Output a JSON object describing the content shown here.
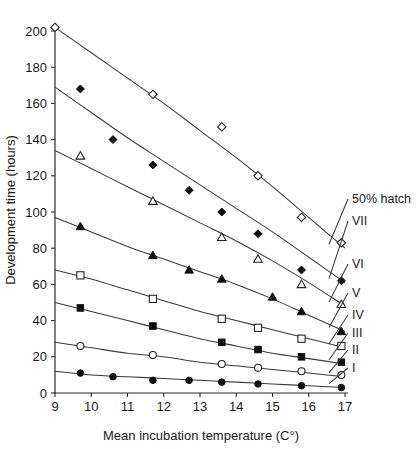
{
  "chart_data": {
    "type": "scatter",
    "title": "",
    "xlabel": "Mean incubation temperature (C°)",
    "ylabel": "Development time (hours)",
    "xlim": [
      9,
      17
    ],
    "ylim": [
      0,
      200
    ],
    "xticks": [
      9,
      10,
      11,
      12,
      13,
      14,
      15,
      16,
      17
    ],
    "yticks": [
      0,
      20,
      40,
      60,
      80,
      100,
      120,
      140,
      160,
      180,
      200
    ],
    "grid": false,
    "legend_position": "right-inline-labels",
    "series": [
      {
        "name": "50% hatch",
        "marker": "open-diamond",
        "fit": "decreasing-convex-curve",
        "x": [
          9.0,
          11.7,
          13.6,
          14.6,
          15.8,
          16.9
        ],
        "y": [
          202,
          165,
          147,
          120,
          97,
          83
        ],
        "fit_x": [
          9.0,
          10.0,
          11.0,
          12.0,
          13.0,
          14.0,
          15.0,
          16.0,
          17.0
        ],
        "fit_y": [
          202,
          188,
          174,
          160,
          145,
          130,
          114,
          97,
          80
        ]
      },
      {
        "name": "VII",
        "marker": "filled-diamond",
        "fit": "decreasing-convex-curve",
        "x": [
          9.7,
          10.6,
          11.7,
          12.7,
          13.6,
          14.6,
          15.8,
          16.9
        ],
        "y": [
          168,
          140,
          126,
          112,
          100,
          88,
          68,
          62
        ],
        "fit_x": [
          9.0,
          10.0,
          11.0,
          12.0,
          13.0,
          14.0,
          15.0,
          16.0,
          17.0
        ],
        "fit_y": [
          169,
          155,
          141,
          128,
          115,
          102,
          89,
          75,
          61
        ]
      },
      {
        "name": "VI",
        "marker": "open-triangle",
        "fit": "decreasing-convex-curve",
        "x": [
          9.7,
          11.7,
          13.6,
          14.6,
          15.8,
          16.9
        ],
        "y": [
          131,
          106,
          86,
          74,
          60,
          49
        ],
        "fit_x": [
          9.0,
          10.0,
          11.0,
          12.0,
          13.0,
          14.0,
          15.0,
          16.0,
          17.0
        ],
        "fit_y": [
          134,
          124,
          114,
          104,
          94,
          84,
          73,
          61,
          48
        ]
      },
      {
        "name": "V",
        "marker": "filled-triangle",
        "fit": "decreasing-convex-curve",
        "x": [
          9.7,
          11.7,
          12.7,
          13.6,
          15.0,
          15.8,
          16.9
        ],
        "y": [
          92,
          76,
          68,
          63,
          53,
          45,
          34
        ],
        "fit_x": [
          9.0,
          10.0,
          11.0,
          12.0,
          13.0,
          14.0,
          15.0,
          16.0,
          17.0
        ],
        "fit_y": [
          97,
          89,
          81,
          74,
          67,
          60,
          52,
          43,
          34
        ]
      },
      {
        "name": "IV",
        "marker": "open-square",
        "fit": "decreasing-convex-curve",
        "x": [
          9.7,
          11.7,
          13.6,
          14.6,
          15.8,
          16.9
        ],
        "y": [
          65,
          52,
          41,
          36,
          30,
          26
        ],
        "fit_x": [
          9.0,
          10.0,
          11.0,
          12.0,
          13.0,
          14.0,
          15.0,
          16.0,
          17.0
        ],
        "fit_y": [
          68,
          63,
          57,
          51,
          45,
          40,
          35,
          30,
          25
        ]
      },
      {
        "name": "III",
        "marker": "filled-square",
        "fit": "decreasing-convex-curve",
        "x": [
          9.7,
          11.7,
          13.6,
          14.6,
          15.8,
          16.9
        ],
        "y": [
          47,
          37,
          28,
          24,
          20,
          17
        ],
        "fit_x": [
          9.0,
          10.0,
          11.0,
          12.0,
          13.0,
          14.0,
          15.0,
          16.0,
          17.0
        ],
        "fit_y": [
          50,
          45,
          40,
          35,
          30,
          26,
          22,
          19,
          16
        ]
      },
      {
        "name": "II",
        "marker": "open-circle",
        "fit": "decreasing-convex-curve",
        "x": [
          9.7,
          11.7,
          13.6,
          14.6,
          15.8,
          16.9
        ],
        "y": [
          26,
          21,
          16,
          14,
          12,
          10
        ],
        "fit_x": [
          9.0,
          10.0,
          11.0,
          12.0,
          13.0,
          14.0,
          15.0,
          16.0,
          17.0
        ],
        "fit_y": [
          28,
          25,
          22,
          20,
          17,
          15,
          13,
          11,
          9
        ]
      },
      {
        "name": "I",
        "marker": "filled-circle",
        "fit": "decreasing-convex-curve",
        "x": [
          9.7,
          10.6,
          11.7,
          12.7,
          13.6,
          14.6,
          15.8,
          16.9
        ],
        "y": [
          11,
          9,
          7,
          7,
          6,
          5,
          4,
          3
        ],
        "fit_x": [
          9.0,
          10.0,
          11.0,
          12.0,
          13.0,
          14.0,
          15.0,
          16.0,
          17.0
        ],
        "fit_y": [
          12,
          10,
          9,
          8,
          7,
          6,
          5,
          4,
          3
        ]
      }
    ],
    "series_labels": [
      {
        "text": "50% hatch",
        "at_y": 203,
        "leader_from_y": 250
      },
      {
        "text": "VII",
        "at_y": 225,
        "leader_from_y": 272
      },
      {
        "text": "VI",
        "at_y": 268,
        "leader_from_y": 305
      },
      {
        "text": "V",
        "at_y": 297,
        "leader_from_y": 322
      },
      {
        "text": "IV",
        "at_y": 319,
        "leader_from_y": 338
      },
      {
        "text": "III",
        "at_y": 337,
        "leader_from_y": 352
      },
      {
        "text": "II",
        "at_y": 354,
        "leader_from_y": 366
      },
      {
        "text": "I",
        "at_y": 372,
        "leader_from_y": 384
      }
    ]
  }
}
